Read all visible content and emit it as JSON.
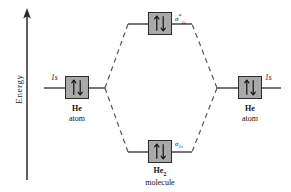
{
  "diagram": {
    "axis": {
      "label": "Energy",
      "direction": "up",
      "color": "#3a3a3a"
    },
    "colors": {
      "box_fill": "#a9a9a9",
      "box_border": "#2b2b2b",
      "line": "#2b2b2b",
      "dashed_line": "#555555",
      "text": "#111111",
      "background": "#ffffff"
    },
    "levels": {
      "antibonding": {
        "orbital_label": "σ",
        "orbital_sub": "1s",
        "orbital_sup": "*",
        "electrons": "↑↓",
        "electron_count": 2
      },
      "bonding": {
        "orbital_label": "σ",
        "orbital_sub": "1s",
        "orbital_sup": "",
        "electrons": "↑↓",
        "electron_count": 2
      },
      "atomic_left": {
        "orbital_label": "1s",
        "electrons": "↑↓",
        "electron_count": 2
      },
      "atomic_right": {
        "orbital_label": "1s",
        "electrons": "↑↓",
        "electron_count": 2
      }
    },
    "species": {
      "left": {
        "name": "He",
        "sub": "",
        "kind": "atom"
      },
      "right": {
        "name": "He",
        "sub": "",
        "kind": "atom"
      },
      "center": {
        "name": "He",
        "sub": "2",
        "kind": "molecule"
      }
    }
  }
}
